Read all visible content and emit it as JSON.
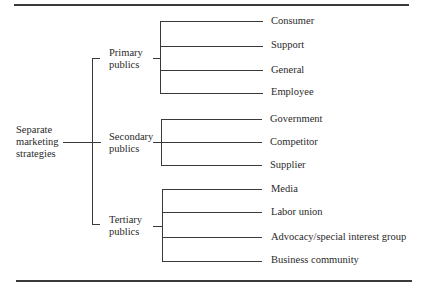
{
  "diagram": {
    "type": "tree",
    "root": {
      "lines": [
        "Separate",
        "marketing",
        "strategies"
      ]
    },
    "groups": [
      {
        "lines": [
          "Primary",
          "publics"
        ],
        "children": [
          "Consumer",
          "Support",
          "General",
          "Employee"
        ]
      },
      {
        "lines": [
          "Secondary",
          "publics"
        ],
        "children": [
          "Government",
          "Competitor",
          "Supplier"
        ]
      },
      {
        "lines": [
          "Tertiary",
          "publics"
        ],
        "children": [
          "Media",
          "Labor union",
          "Advocacy/special interest group",
          "Business community"
        ]
      }
    ]
  },
  "colors": {
    "line": "#3a3a3a",
    "text": "#2a2a2a",
    "background": "#ffffff"
  }
}
